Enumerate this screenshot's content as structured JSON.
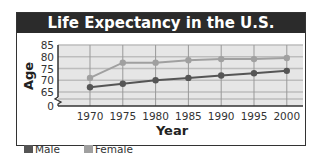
{
  "chart_data": {
    "type": "line",
    "title": "Life Expectancy in the U.S.",
    "xlabel": "Year",
    "ylabel": "Age",
    "x": [
      1970,
      1975,
      1980,
      1985,
      1990,
      1995,
      2000
    ],
    "yticks": [
      0,
      65,
      70,
      75,
      80,
      85
    ],
    "ylim": [
      65,
      85
    ],
    "axis_break": true,
    "grid": true,
    "legend_position": "bottom-left",
    "series": [
      {
        "name": "Male",
        "color": "#555555",
        "values": [
          67,
          68.5,
          70,
          71,
          72,
          73,
          74
        ]
      },
      {
        "name": "Female",
        "color": "#a0a0a0",
        "values": [
          71,
          77.5,
          77.5,
          78.5,
          79,
          79,
          79.5
        ]
      }
    ]
  },
  "legend": {
    "male": "Male",
    "female": "Female"
  }
}
